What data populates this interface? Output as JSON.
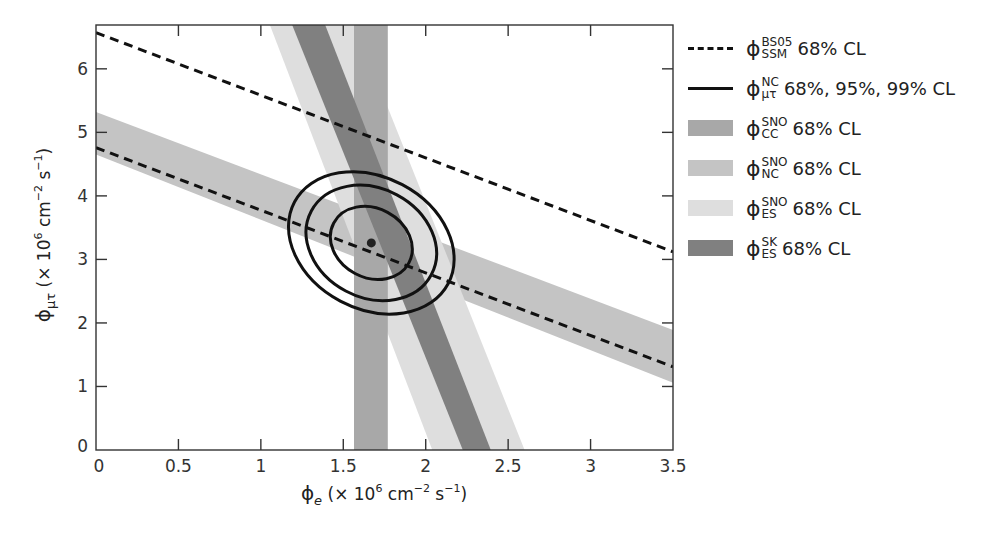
{
  "chart_data": {
    "type": "band-contour",
    "title": "",
    "xlabel": "ϕe (× 10^6 cm^-2 s^-1)",
    "ylabel": "ϕμτ (× 10^6 cm^-2 s^-1)",
    "xlim": [
      0,
      3.5
    ],
    "ylim": [
      0,
      6.69
    ],
    "xticks": [
      0,
      0.5,
      1,
      1.5,
      2,
      2.5,
      3,
      3.5
    ],
    "xtick_labels": [
      "0",
      "0.5",
      "1",
      "1.5",
      "2",
      "2.5",
      "3",
      "3.5"
    ],
    "yticks": [
      0,
      1,
      2,
      3,
      4,
      5,
      6
    ],
    "ytick_labels": [
      "0",
      "1",
      "2",
      "3",
      "4",
      "5",
      "6"
    ],
    "grid": false,
    "legend_position": "right",
    "series": [
      {
        "name": "ϕSSM BS05 68% CL",
        "kind": "dashed-lines",
        "color": "#111111",
        "lines": [
          {
            "x": [
              0,
              3.5
            ],
            "y": [
              6.57,
              3.12
            ]
          },
          {
            "x": [
              0,
              3.5
            ],
            "y": [
              4.76,
              1.31
            ]
          }
        ]
      },
      {
        "name": "ϕSNO NC 68% CL",
        "kind": "band",
        "color": "#c4c4c4",
        "polygon": [
          [
            0,
            5.32
          ],
          [
            3.5,
            1.89
          ],
          [
            3.5,
            1.06
          ],
          [
            0,
            4.65
          ]
        ]
      },
      {
        "name": "ϕSNO ES 68% CL",
        "kind": "band",
        "color": "#dedede",
        "polygon": [
          [
            1.055,
            6.69
          ],
          [
            1.57,
            6.69
          ],
          [
            2.6,
            0
          ],
          [
            2.04,
            0
          ]
        ]
      },
      {
        "name": "ϕSNO CC 68% CL",
        "kind": "band",
        "color": "#a8a8a8",
        "polygon": [
          [
            1.565,
            6.69
          ],
          [
            1.77,
            6.69
          ],
          [
            1.77,
            0
          ],
          [
            1.565,
            0
          ]
        ]
      },
      {
        "name": "ϕSK ES 68% CL",
        "kind": "band",
        "color": "#808080",
        "polygon": [
          [
            1.19,
            6.69
          ],
          [
            1.39,
            6.69
          ],
          [
            2.395,
            0
          ],
          [
            2.225,
            0
          ]
        ]
      },
      {
        "name": "ϕμτ NC 68%, 95%, 99% CL",
        "kind": "contours",
        "color": "#111111",
        "center": [
          1.67,
          3.26
        ],
        "ellipses": [
          {
            "level": "68%",
            "rx": 0.67,
            "ry": 0.21,
            "angle_deg": -62
          },
          {
            "level": "95%",
            "rx": 1.07,
            "ry": 0.33,
            "angle_deg": -62
          },
          {
            "level": "99%",
            "rx": 1.37,
            "ry": 0.4,
            "angle_deg": -62
          }
        ]
      },
      {
        "name": "best fit",
        "kind": "point",
        "x": 1.67,
        "y": 3.26,
        "color": "#222222"
      }
    ]
  },
  "axes": {
    "xlabel_main": "ϕ",
    "xlabel_sub": "e",
    "xlabel_unit_pre": " (× 10",
    "xlabel_exp": "6",
    "xlabel_unit_mid": " cm",
    "xlabel_exp2": "−2",
    "xlabel_unit_s": " s",
    "xlabel_exp3": "−1",
    "xlabel_close": ")",
    "ylabel_main": "ϕ",
    "ylabel_sub": "μτ",
    "ylabel_unit_pre": " (× 10",
    "ylabel_exp": "6",
    "ylabel_unit_mid": " cm",
    "ylabel_exp2": "−2",
    "ylabel_unit_s": " s",
    "ylabel_exp3": "−1",
    "ylabel_close": ")"
  },
  "legend": {
    "items": [
      {
        "symbol": "dashed",
        "phi": "ϕ",
        "sup": "BS05",
        "sub": "SSM",
        "text": "68% CL",
        "color": "#111111"
      },
      {
        "symbol": "solid",
        "phi": "ϕ",
        "sup": "NC",
        "sub": "μτ",
        "text": "68%, 95%, 99% CL",
        "color": "#111111"
      },
      {
        "symbol": "swatch",
        "phi": "ϕ",
        "sup": "SNO",
        "sub": "CC",
        "text": "68% CL",
        "color": "#a8a8a8"
      },
      {
        "symbol": "swatch",
        "phi": "ϕ",
        "sup": "SNO",
        "sub": "NC",
        "text": "68% CL",
        "color": "#c4c4c4"
      },
      {
        "symbol": "swatch",
        "phi": "ϕ",
        "sup": "SNO",
        "sub": "ES",
        "text": "68% CL",
        "color": "#dedede"
      },
      {
        "symbol": "swatch",
        "phi": "ϕ",
        "sup": "SK",
        "sub": "ES",
        "text": "68% CL",
        "color": "#808080"
      }
    ]
  }
}
